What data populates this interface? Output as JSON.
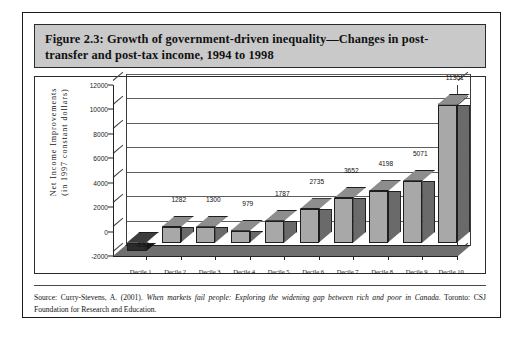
{
  "figure": {
    "title_line1": "Figure 2.3: Growth of government-driven inequality—Changes in post-",
    "title_line2": "transfer and post-tax income, 1994 to 1998",
    "source_prefix": "Source: Curry-Stevens, A. (2001). ",
    "source_italic": "When markets fail people: Exploring the widening gap between rich and poor in Canada",
    "source_suffix": ". Toronto: CSJ Foundation for Research and Education."
  },
  "chart_data": {
    "type": "bar",
    "xlabel": "",
    "ylabel": "Net Income Improvements (in 1997 constant dollars)",
    "ylabel_line1": "Net Income Improvements",
    "ylabel_line2": "(in 1997 constant dollars)",
    "categories": [
      "Decile 1",
      "Decile 2",
      "Decile 3",
      "Decile 4",
      "Decile 5",
      "Decile 6",
      "Decile 7",
      "Decile 8",
      "Decile 9",
      "Decile 10"
    ],
    "values": [
      -690,
      1282,
      1300,
      979,
      1787,
      2735,
      3652,
      4198,
      5071,
      11301
    ],
    "value_labels": [
      "-690",
      "1282",
      "1300",
      "979",
      "1787",
      "2735",
      "3652",
      "4198",
      "5071",
      "11301"
    ],
    "ylim": [
      -2000,
      12000
    ],
    "yticks": [
      -2000,
      0,
      2000,
      4000,
      6000,
      8000,
      10000,
      12000
    ],
    "ytick_labels": [
      "-2000",
      "0",
      "2000",
      "4000",
      "6000",
      "8000",
      "10000",
      "12000"
    ],
    "grid": true,
    "legend": "none",
    "style": "3d-column",
    "colors": {
      "bar_front": "#a8a8a8",
      "bar_side": "#6a6a6a",
      "bar_top": "#8d8d8d",
      "negative_bar": "#2b2b2b",
      "title_band": "#c9c9c9",
      "grid": "#5e5e5e",
      "axis": "#222222"
    }
  }
}
